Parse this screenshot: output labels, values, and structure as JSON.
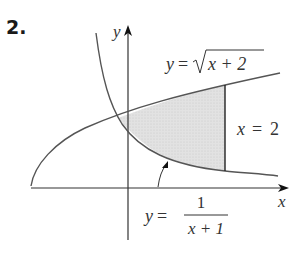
{
  "problem_number": "2.",
  "axes": {
    "x_label": "x",
    "y_label": "y"
  },
  "curves": {
    "upper": {
      "label_lhs": "y",
      "label_eq": "=",
      "label_rad": "x + 2",
      "expression": "y = sqrt(x + 2)"
    },
    "lower": {
      "label_lhs": "y",
      "label_eq": "=",
      "label_num": "1",
      "label_den": "x + 1",
      "expression": "y = 1/(x + 1)"
    },
    "boundary": {
      "label_var": "x",
      "label_eq": "=",
      "label_val": "2",
      "expression": "x = 2"
    }
  },
  "colors": {
    "curve": "#555555",
    "axis": "#333333",
    "shade": "#dcdcdc"
  }
}
